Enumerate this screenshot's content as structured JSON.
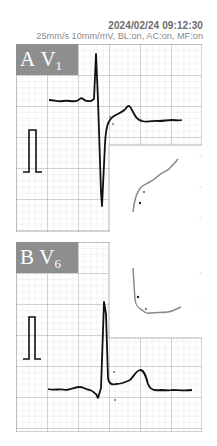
{
  "header": {
    "timestamp": "2024/02/24 09:12:30",
    "settings": "25mm/s 10mm/mV, BL:on, AC:on, MF:on"
  },
  "panels": [
    {
      "letter": "A",
      "lead": "V",
      "lead_sub": "1",
      "description": "Lead V1 ECG trace with rS complex and inset magnified J-point/ST segment curve"
    },
    {
      "letter": "B",
      "lead": "V",
      "lead_sub": "6",
      "description": "Lead V6 ECG trace with tall R wave and inset magnified S-wave upstroke curve"
    }
  ],
  "colors": {
    "grid_major": "#a8a8a8",
    "grid_minor": "#dcdcdc",
    "trace": "#111111",
    "inset_trace": "#8a8a8a",
    "label_bg": "#8e8e8e",
    "header_text": "#6b6b6b"
  },
  "scale": {
    "paper_speed": "25mm/s",
    "gain": "10mm/mV"
  }
}
